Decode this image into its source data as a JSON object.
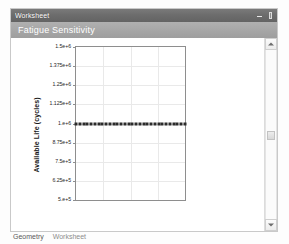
{
  "window": {
    "title": "Worksheet",
    "buttons": [
      {
        "name": "minimize-button",
        "icon": "minimize-icon",
        "label": "–"
      },
      {
        "name": "autohide-button",
        "icon": "pin-icon",
        "label": "⌶"
      }
    ]
  },
  "caption": {
    "text": "Fatigue Sensitivity"
  },
  "scrollbar": {
    "up_arrow": "▲",
    "down_arrow": "▼"
  },
  "tabs": [
    {
      "label": "Geometry",
      "active": false
    },
    {
      "label": "Worksheet",
      "active": true
    }
  ],
  "colors": {
    "titlebar": "#6d6d6d",
    "caption_band": "#a5a5a5",
    "plot_frame": "#8e8e8e",
    "gridline": "#e9e9e9",
    "marker": "#2b2b2b",
    "window_border": "#c9c9c9"
  },
  "chart_data": {
    "type": "scatter",
    "title": "Fatigue Sensitivity",
    "xlabel": "",
    "ylabel": "Available Life (cycles)",
    "ylim": [
      500000,
      1500000
    ],
    "xlim": [
      0,
      1
    ],
    "grid": true,
    "legend": "none",
    "ytick_labels": [
      "1.5e+6",
      "1.375e+6",
      "1.25e+6",
      "1.125e+6",
      "1.e+6",
      "8.75e+5",
      "7.5e+5",
      "6.25e+5",
      "5.e+5"
    ],
    "ytick_values": [
      1500000,
      1375000,
      1250000,
      1125000,
      1000000,
      875000,
      750000,
      625000,
      500000
    ],
    "xtick_labels": [],
    "series": [
      {
        "name": "Available Life",
        "marker": "square",
        "x": [
          0.0,
          0.034,
          0.069,
          0.103,
          0.138,
          0.172,
          0.207,
          0.241,
          0.276,
          0.31,
          0.345,
          0.379,
          0.414,
          0.448,
          0.483,
          0.517,
          0.552,
          0.586,
          0.621,
          0.655,
          0.69,
          0.724,
          0.759,
          0.793,
          0.828,
          0.862,
          0.897,
          0.931,
          0.966,
          1.0
        ],
        "values": [
          1000000,
          1000000,
          1000000,
          1000000,
          1000000,
          1000000,
          1000000,
          1000000,
          1000000,
          1000000,
          1000000,
          1000000,
          1000000,
          1000000,
          1000000,
          1000000,
          1000000,
          1000000,
          1000000,
          1000000,
          1000000,
          1000000,
          1000000,
          1000000,
          1000000,
          1000000,
          1000000,
          1000000,
          1000000,
          1000000
        ]
      }
    ]
  }
}
